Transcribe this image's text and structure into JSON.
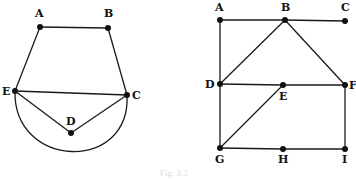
{
  "figure": {
    "caption": "Fig. 3.3",
    "colors": {
      "ink": "#111111",
      "background": "#ffffff"
    },
    "left_graph": {
      "name": "planar graph with arc",
      "vertices": [
        {
          "id": "A",
          "label": "A",
          "x": 40,
          "y": 27,
          "lx": 35,
          "ly": 17
        },
        {
          "id": "B",
          "label": "B",
          "x": 108,
          "y": 28,
          "lx": 104,
          "ly": 17
        },
        {
          "id": "C",
          "label": "C",
          "x": 127,
          "y": 95,
          "lx": 132,
          "ly": 99
        },
        {
          "id": "D",
          "label": "D",
          "x": 71,
          "y": 133,
          "lx": 66,
          "ly": 125
        },
        {
          "id": "E",
          "label": "E",
          "x": 15,
          "y": 91,
          "lx": 2,
          "ly": 95
        }
      ],
      "edges": [
        [
          "A",
          "B"
        ],
        [
          "B",
          "C"
        ],
        [
          "A",
          "E"
        ],
        [
          "E",
          "C"
        ],
        [
          "E",
          "D"
        ],
        [
          "D",
          "C"
        ]
      ],
      "arc": {
        "from": "E",
        "to": "C",
        "description": "semicircular curve below E-C through bottom y≈150"
      }
    },
    "right_graph": {
      "name": "grid graph",
      "vertices": [
        {
          "id": "A",
          "label": "A",
          "x": 220,
          "y": 20,
          "lx": 215,
          "ly": 11
        },
        {
          "id": "B",
          "label": "B",
          "x": 285,
          "y": 20,
          "lx": 281,
          "ly": 11
        },
        {
          "id": "C",
          "label": "C",
          "x": 345,
          "y": 21,
          "lx": 341,
          "ly": 11
        },
        {
          "id": "D",
          "label": "D",
          "x": 220,
          "y": 84,
          "lx": 205,
          "ly": 88
        },
        {
          "id": "E",
          "label": "E",
          "x": 283,
          "y": 85,
          "lx": 279,
          "ly": 100
        },
        {
          "id": "F",
          "label": "F",
          "x": 345,
          "y": 85,
          "lx": 349,
          "ly": 89
        },
        {
          "id": "G",
          "label": "G",
          "x": 220,
          "y": 148,
          "lx": 215,
          "ly": 163
        },
        {
          "id": "H",
          "label": "H",
          "x": 283,
          "y": 149,
          "lx": 278,
          "ly": 163
        },
        {
          "id": "I",
          "label": "I",
          "x": 345,
          "y": 149,
          "lx": 342,
          "ly": 163
        }
      ],
      "edges": [
        [
          "A",
          "B"
        ],
        [
          "B",
          "C"
        ],
        [
          "A",
          "D"
        ],
        [
          "B",
          "D"
        ],
        [
          "B",
          "F"
        ],
        [
          "D",
          "E"
        ],
        [
          "E",
          "F"
        ],
        [
          "D",
          "G"
        ],
        [
          "E",
          "G"
        ],
        [
          "F",
          "I"
        ],
        [
          "G",
          "H"
        ],
        [
          "H",
          "I"
        ]
      ]
    }
  }
}
